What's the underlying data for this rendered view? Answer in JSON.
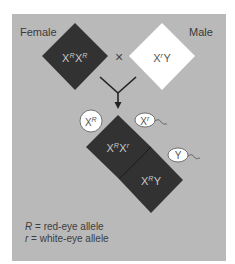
{
  "colors": {
    "panel_bg": "#b9b9b9",
    "dark_fill": "#323232",
    "light_fill": "#ffffff",
    "arrow": "#222222"
  },
  "parents": {
    "female": {
      "label": "Female",
      "genotype": {
        "base1": "X",
        "allele1": "R",
        "base2": "X",
        "allele2": "R"
      }
    },
    "cross_symbol": "×",
    "male": {
      "label": "Male",
      "genotype": {
        "base1": "X",
        "allele1": "r",
        "base2": "Y"
      }
    }
  },
  "gametes": {
    "egg": {
      "base": "X",
      "allele": "R"
    },
    "sperm": [
      {
        "base": "X",
        "allele": "r"
      },
      {
        "base": "Y"
      }
    ]
  },
  "offspring": [
    {
      "base1": "X",
      "allele1": "R",
      "base2": "X",
      "allele2": "r"
    },
    {
      "base1": "X",
      "allele1": "R",
      "base2": "Y"
    }
  ],
  "legend": [
    {
      "symbol": "R",
      "text": " = red-eye allele"
    },
    {
      "symbol": "r",
      "text": " = white-eye allele"
    }
  ]
}
